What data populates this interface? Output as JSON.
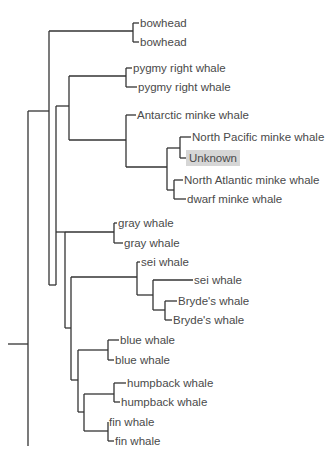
{
  "diagram": {
    "type": "phylogenetic-tree",
    "highlight_color": "#d6d6d6",
    "line_color": "#333333",
    "text_color": "#4a4a4a",
    "leaves": [
      {
        "id": "l0",
        "label": "bowhead",
        "x": 140,
        "y": 23
      },
      {
        "id": "l1",
        "label": "bowhead",
        "x": 140,
        "y": 42
      },
      {
        "id": "l2",
        "label": "pygmy right whale",
        "x": 133,
        "y": 68
      },
      {
        "id": "l3",
        "label": "pygmy right whale",
        "x": 138,
        "y": 87
      },
      {
        "id": "l4",
        "label": "Antarctic minke whale",
        "x": 137,
        "y": 115
      },
      {
        "id": "l5",
        "label": "North Pacific minke whale",
        "x": 192,
        "y": 137
      },
      {
        "id": "l6",
        "label": "Unknown",
        "x": 189,
        "y": 158,
        "highlighted": true
      },
      {
        "id": "l7",
        "label": "North Atlantic minke whale",
        "x": 184,
        "y": 180
      },
      {
        "id": "l8",
        "label": "dwarf minke whale",
        "x": 187,
        "y": 199
      },
      {
        "id": "l9",
        "label": "gray whale",
        "x": 118,
        "y": 223
      },
      {
        "id": "l10",
        "label": "gray whale",
        "x": 124,
        "y": 243
      },
      {
        "id": "l11",
        "label": "sei whale",
        "x": 141,
        "y": 262
      },
      {
        "id": "l12",
        "label": "sei whale",
        "x": 194,
        "y": 280
      },
      {
        "id": "l13",
        "label": "Bryde's whale",
        "x": 178,
        "y": 301
      },
      {
        "id": "l14",
        "label": "Bryde's whale",
        "x": 173,
        "y": 320
      },
      {
        "id": "l15",
        "label": "blue whale",
        "x": 120,
        "y": 340
      },
      {
        "id": "l16",
        "label": "blue whale",
        "x": 115,
        "y": 360
      },
      {
        "id": "l17",
        "label": "humpback whale",
        "x": 127,
        "y": 383
      },
      {
        "id": "l18",
        "label": "humpback whale",
        "x": 121,
        "y": 402
      },
      {
        "id": "l19",
        "label": "fin whale",
        "x": 109,
        "y": 422
      },
      {
        "id": "l20",
        "label": "fin whale",
        "x": 115,
        "y": 441
      }
    ],
    "branches": [
      "M8 344 H28",
      "M28 111 V446",
      "M28 111 H49",
      "M49 31 V285",
      "M49 31 H133",
      "M133 23 V42",
      "M133 23 H139",
      "M133 42 H139",
      "M49 285 H56",
      "M56 106 V285",
      "M56 106 H69",
      "M69 76 V140",
      "M69 76 H126",
      "M126 68 V87",
      "M126 68 H132",
      "M126 87 H137",
      "M69 140 H126",
      "M126 115 V167",
      "M126 115 H136",
      "M126 167 H167",
      "M167 148 V190",
      "M167 148 H180",
      "M180 137 V158",
      "M180 137 H191",
      "M180 158 H188",
      "M167 190 H174",
      "M174 180 V199",
      "M174 180 H183",
      "M174 199 H186",
      "M56 232 H65",
      "M65 232 V328",
      "M65 232 H114",
      "M114 223 V243",
      "M114 223 H117",
      "M114 243 H123",
      "M65 328 H71",
      "M71 277 V380",
      "M71 277 H137",
      "M137 262 V295",
      "M137 262 H140",
      "M137 295 H153",
      "M153 280 V310",
      "M153 280 H193",
      "M153 310 H165",
      "M165 301 V320",
      "M165 301 H177",
      "M165 320 H172",
      "M71 380 H78",
      "M78 350 V412",
      "M78 350 H108",
      "M108 340 V360",
      "M108 340 H119",
      "M108 360 H114",
      "M78 412 H84",
      "M84 394 V431",
      "M84 394 H114",
      "M114 383 V402",
      "M114 383 H126",
      "M114 402 H120",
      "M84 431 H108",
      "M108 422 V441",
      "M108 422 H108",
      "M108 441 H114"
    ]
  }
}
